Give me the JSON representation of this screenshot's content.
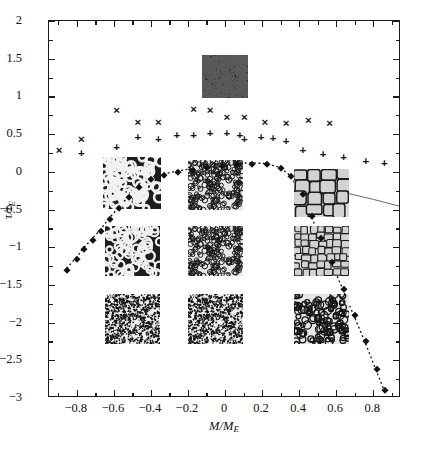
{
  "chart_data": {
    "type": "scatter",
    "title": "",
    "xlabel": "M/M_E",
    "ylabel": "tau/tau_E",
    "xlim": [
      -0.95,
      0.95
    ],
    "ylim": [
      -3,
      2
    ],
    "xticks": [
      -0.8,
      -0.6,
      -0.4,
      -0.2,
      0,
      0.2,
      0.4,
      0.6,
      0.8
    ],
    "xticklabels": [
      "-0.8",
      "-0.6",
      "-0.4",
      "-0.2",
      "0",
      "0.2",
      "0.4",
      "0.6",
      "0.8"
    ],
    "yticks": [
      2,
      1.5,
      1,
      0.5,
      0,
      -0.5,
      -1,
      -1.5,
      -2,
      -2.5,
      -3
    ],
    "yticklabels": [
      "2",
      "1.5",
      "1",
      "0.5",
      "0",
      "−0.5",
      "−1",
      "−1.5",
      "−2",
      "−2.5",
      "−3"
    ],
    "grid": false,
    "legend": "none",
    "series": [
      {
        "name": "upper-bound-crosses",
        "marker": "x",
        "color": "#111111",
        "points": [
          [
            -0.895,
            0.27
          ],
          [
            -0.775,
            0.42
          ],
          [
            -0.585,
            0.8
          ],
          [
            -0.47,
            0.65
          ],
          [
            -0.36,
            0.65
          ],
          [
            -0.17,
            0.82
          ],
          [
            -0.08,
            0.8
          ],
          [
            0.01,
            0.72
          ],
          [
            0.105,
            0.72
          ],
          [
            0.215,
            0.65
          ],
          [
            0.33,
            0.63
          ],
          [
            0.45,
            0.67
          ],
          [
            0.565,
            0.63
          ]
        ]
      },
      {
        "name": "transition-plus",
        "marker": "+",
        "color": "#111111",
        "points": [
          [
            -0.775,
            0.23
          ],
          [
            -0.585,
            0.32
          ],
          [
            -0.47,
            0.45
          ],
          [
            -0.36,
            0.42
          ],
          [
            -0.26,
            0.47
          ],
          [
            -0.17,
            0.47
          ],
          [
            -0.08,
            0.5
          ],
          [
            0.01,
            0.5
          ],
          [
            0.08,
            0.47
          ],
          [
            0.105,
            0.42
          ],
          [
            0.195,
            0.45
          ],
          [
            0.26,
            0.43
          ],
          [
            0.33,
            0.4
          ],
          [
            0.42,
            0.28
          ],
          [
            0.53,
            0.22
          ],
          [
            0.64,
            0.18
          ],
          [
            0.76,
            0.13
          ],
          [
            0.86,
            0.1
          ]
        ]
      },
      {
        "name": "yield-surface-squares",
        "marker": "s",
        "color": "#111111",
        "linestyle": "dotted",
        "points": [
          [
            -0.855,
            -1.3
          ],
          [
            -0.8,
            -1.15
          ],
          [
            -0.76,
            -1.02
          ],
          [
            -0.715,
            -0.9
          ],
          [
            -0.67,
            -0.78
          ],
          [
            -0.62,
            -0.62
          ],
          [
            -0.57,
            -0.48
          ],
          [
            -0.52,
            -0.33
          ],
          [
            -0.465,
            -0.2
          ],
          [
            -0.4,
            -0.1
          ],
          [
            -0.33,
            -0.04
          ],
          [
            -0.255,
            0.0
          ],
          [
            -0.175,
            0.03
          ],
          [
            -0.095,
            0.06
          ],
          [
            -0.015,
            0.08
          ],
          [
            0.065,
            0.1
          ],
          [
            0.145,
            0.11
          ],
          [
            0.225,
            0.1
          ],
          [
            0.3,
            0.05
          ],
          [
            0.355,
            -0.05
          ],
          [
            0.42,
            -0.3
          ],
          [
            0.47,
            -0.58
          ],
          [
            0.52,
            -0.88
          ],
          [
            0.58,
            -1.2
          ],
          [
            0.64,
            -1.55
          ],
          [
            0.7,
            -1.9
          ],
          [
            0.76,
            -2.25
          ],
          [
            0.82,
            -2.62
          ],
          [
            0.865,
            -2.9
          ]
        ]
      }
    ],
    "curve_annotations": [
      {
        "name": "upper-right-thin-curve",
        "description": "thin solid curve through plus markers on right side"
      }
    ],
    "insets": [
      {
        "name": "inset-dark-top-center",
        "x": 0.0,
        "y": 1.27,
        "texture": "dense-dark"
      },
      {
        "name": "inset-left-upper",
        "x": -0.5,
        "y": -0.15,
        "texture": "coarse-dark-foam"
      },
      {
        "name": "inset-center-upper",
        "x": -0.05,
        "y": -0.17,
        "texture": "fine-grains"
      },
      {
        "name": "inset-right-upper",
        "x": 0.52,
        "y": -0.28,
        "texture": "large-polygons"
      },
      {
        "name": "inset-left-middle",
        "x": -0.5,
        "y": -1.05,
        "texture": "coarse-bubbles"
      },
      {
        "name": "inset-center-middle",
        "x": -0.05,
        "y": -1.05,
        "texture": "fine-grains"
      },
      {
        "name": "inset-right-middle",
        "x": 0.52,
        "y": -1.05,
        "texture": "medium-polygons"
      },
      {
        "name": "inset-left-lower",
        "x": -0.5,
        "y": -1.95,
        "texture": "fine-dense"
      },
      {
        "name": "inset-center-lower",
        "x": -0.05,
        "y": -1.95,
        "texture": "fine-dense"
      },
      {
        "name": "inset-right-lower",
        "x": 0.52,
        "y": -1.95,
        "texture": "medium-bubbles"
      }
    ]
  }
}
